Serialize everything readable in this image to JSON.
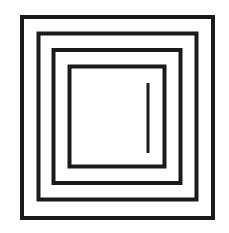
{
  "diagram": {
    "background": "#ffffff",
    "stroke_color": "#1a1a1a",
    "squares": [
      {
        "name": "outer-square",
        "x": 22,
        "y": 17,
        "w": 191,
        "h": 201,
        "stroke": 4
      },
      {
        "name": "second-square",
        "x": 38.5,
        "y": 33.5,
        "w": 158,
        "h": 166,
        "stroke": 4
      },
      {
        "name": "third-square",
        "x": 53.5,
        "y": 50,
        "w": 127,
        "h": 133,
        "stroke": 4
      },
      {
        "name": "inner-square",
        "x": 69.5,
        "y": 66.5,
        "w": 95,
        "h": 100,
        "stroke": 4
      }
    ],
    "line": {
      "name": "vertical-line",
      "x1": 148,
      "y1": 83,
      "x2": 148,
      "y2": 153,
      "stroke": 3
    }
  }
}
